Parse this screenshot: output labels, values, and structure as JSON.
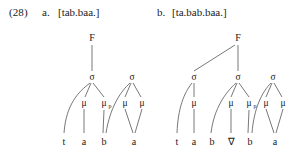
{
  "example": {
    "number": "(28)"
  },
  "items": [
    {
      "label": "a.",
      "form": "[tab.baa.]",
      "tree": {
        "foot": "F",
        "syllables": [
          "σ",
          "σ"
        ],
        "moras": [
          "μ",
          "μ",
          "μ",
          "μ"
        ],
        "mora_subscripts": [
          "",
          "p",
          "",
          ""
        ],
        "segments": [
          "t",
          "a",
          "b",
          "a"
        ]
      }
    },
    {
      "label": "b.",
      "form": "[ta.bab.baa.]",
      "tree": {
        "foot": "F",
        "syllables": [
          "σ",
          "σ",
          "σ"
        ],
        "moras": [
          "μ",
          "μ",
          "μ",
          "μ",
          "μ"
        ],
        "mora_subscripts": [
          "",
          "",
          "p",
          "",
          ""
        ],
        "segments": [
          "t",
          "a",
          "b",
          "∇",
          "b",
          "a"
        ]
      }
    }
  ],
  "colors": {
    "ink": "#1a1a1a",
    "line": "#555555",
    "background": "#ffffff"
  }
}
